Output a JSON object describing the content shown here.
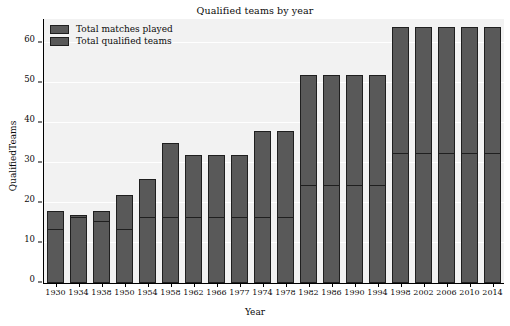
{
  "chart_data": {
    "type": "bar",
    "title": "Qualified teams by year",
    "xlabel": "Year",
    "ylabel": "QualifiedTeams",
    "ylim": [
      0,
      66
    ],
    "yticks": [
      0,
      10,
      20,
      30,
      40,
      50,
      60
    ],
    "grid": true,
    "legend_position": "upper left",
    "categories": [
      "1930",
      "1934",
      "1938",
      "1950",
      "1954",
      "1958",
      "1962",
      "1966",
      "1977",
      "1974",
      "1978",
      "1982",
      "1986",
      "1990",
      "1994",
      "1998",
      "2002",
      "2006",
      "2010",
      "2014"
    ],
    "series": [
      {
        "name": "Total matches played",
        "values": [
          18,
          17,
          18,
          22,
          26,
          35,
          32,
          32,
          32,
          38,
          38,
          52,
          52,
          52,
          52,
          64,
          64,
          64,
          64,
          64
        ]
      },
      {
        "name": "Total qualified teams",
        "values": [
          13,
          16,
          15,
          13,
          16,
          16,
          16,
          16,
          16,
          16,
          16,
          24,
          24,
          24,
          24,
          32,
          32,
          32,
          32,
          32
        ]
      }
    ],
    "colors": {
      "bar_fill": "#595959",
      "bar_edge": "#1f1f1f",
      "plot_background": "#f2f2f2",
      "grid": "#ffffff",
      "text": "#0b0b0b"
    }
  },
  "legend": {
    "items": [
      {
        "label": "Total matches played"
      },
      {
        "label": "Total qualified teams"
      }
    ]
  }
}
